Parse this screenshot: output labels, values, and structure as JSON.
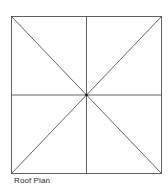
{
  "diagram": {
    "caption": "Roof Plan",
    "line_color": "#3a3a3a",
    "square": {
      "x1": 11.5,
      "y1": 16.5,
      "x2": 161.5,
      "y2": 173.5
    },
    "center": {
      "x": 86.5,
      "y": 95
    }
  }
}
